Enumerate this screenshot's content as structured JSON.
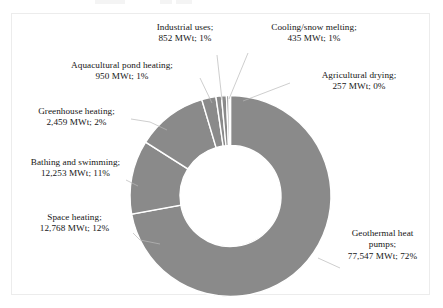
{
  "chart_data": {
    "type": "pie",
    "variant": "donut",
    "title": "",
    "subtitle": "",
    "xlabel": "",
    "ylabel": "",
    "unit": "MWt",
    "legend_position": "none",
    "grid": false,
    "label_format": "{name}; {value} MWt; {percent}%",
    "total_value": 107521,
    "categories": [
      "Geothermal heat pumps",
      "Space heating",
      "Bathing and swimming",
      "Greenhouse heating",
      "Aquacultural pond heating",
      "Industrial uses",
      "Cooling/snow melting",
      "Agricultural drying"
    ],
    "values": [
      77547,
      12768,
      12253,
      2459,
      950,
      852,
      435,
      257
    ],
    "percents": [
      72,
      12,
      11,
      2,
      1,
      1,
      1,
      0
    ],
    "value_labels": [
      "77,547",
      "12,768",
      "12,253",
      "2,459",
      "950",
      "852",
      "435",
      "257"
    ],
    "percent_labels": [
      "72%",
      "12%",
      "11%",
      "2%",
      "1%",
      "1%",
      "1%",
      "0%"
    ],
    "slice_color": "#8a8a8a",
    "slice_border_color": "#ffffff",
    "background_color": "#ffffff",
    "frame_color": "#ececec"
  },
  "labels": {
    "geothermal_heat_pumps": {
      "line1": "Geothermal heat",
      "line2": "pumps;",
      "line3": "77,547 MWt; 72%"
    },
    "space_heating": {
      "line1": "Space heating;",
      "line2": "12,768 MWt; 12%"
    },
    "bathing_and_swimming": {
      "line1": "Bathing and swimming;",
      "line2": "12,253 MWt; 11%"
    },
    "greenhouse_heating": {
      "line1": "Greenhouse heating;",
      "line2": "2,459 MWt; 2%"
    },
    "aquacultural_pond_heating": {
      "line1": "Aquacultural pond heating;",
      "line2": "950 MWt; 1%"
    },
    "industrial_uses": {
      "line1": "Industrial uses;",
      "line2": "852 MWt; 1%"
    },
    "cooling_snow_melting": {
      "line1": "Cooling/snow melting;",
      "line2": "435 MWt; 1%"
    },
    "agricultural_drying": {
      "line1": "Agricultural drying;",
      "line2": "257 MWt; 0%"
    }
  }
}
